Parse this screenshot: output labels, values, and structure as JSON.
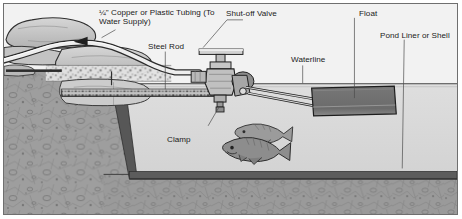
{
  "diagram": {
    "type": "cross-section illustration",
    "labels": {
      "tubing": "¼\" Copper or Plastic Tubing (To Water Supply)",
      "shutoff_valve": "Shut-off Valve",
      "float": "Float",
      "steel_rod": "Steel Rod",
      "waterline": "Waterline",
      "pond_liner": "Pond Liner or Shell",
      "clamp": "Clamp"
    },
    "parts": [
      {
        "name": "tubing",
        "label": "¼\" Copper or Plastic Tubing (To Water Supply)"
      },
      {
        "name": "shut-off-valve",
        "label": "Shut-off Valve"
      },
      {
        "name": "float",
        "label": "Float"
      },
      {
        "name": "steel-rod",
        "label": "Steel Rod"
      },
      {
        "name": "waterline",
        "label": "Waterline"
      },
      {
        "name": "pond-liner",
        "label": "Pond Liner or Shell"
      },
      {
        "name": "clamp",
        "label": "Clamp"
      }
    ],
    "colors": {
      "sky": "#f1f1f1",
      "soil": "#9a9a9a",
      "water": "#d9d9d9",
      "rock": "#c8c8c8",
      "float_body": "#6e6e6e",
      "liner": "#555555",
      "metal": "#b4b4b4",
      "outline": "#2b2b2b",
      "frame_border": "#6f6f6f",
      "text": "#1a1a1a"
    }
  }
}
